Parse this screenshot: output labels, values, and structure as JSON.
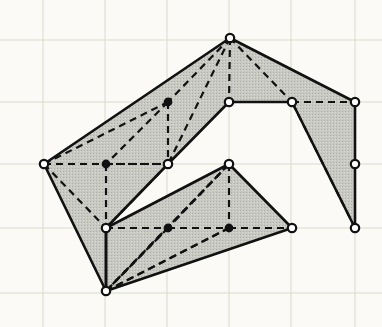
{
  "figure": {
    "title": "Triangulated simple polygon diagram",
    "background_color": "#fbfaf7",
    "grid_color": "#d8dcc8",
    "fill_color": "#c9c9c4",
    "edge_color": "#111111",
    "vertex_open_fill": "#ffffff",
    "vertex_filled_fill": "#111111"
  },
  "grid": {
    "visible": true,
    "vertical_lines": [
      43,
      105,
      167,
      229,
      291,
      355
    ],
    "horizontal_lines": [
      40,
      102,
      164,
      228,
      293
    ]
  },
  "chart_data": {
    "type": "diagram",
    "title": "Triangulated simple polygon diagram",
    "xlabel": "",
    "ylabel": "",
    "xlim": [
      0,
      382
    ],
    "ylim": [
      0,
      327
    ],
    "grid": true,
    "legend": "none",
    "vertices": [
      {
        "id": "A",
        "x": 230,
        "y": 38,
        "marker": "open"
      },
      {
        "id": "B",
        "x": 355,
        "y": 102,
        "marker": "open"
      },
      {
        "id": "C",
        "x": 355,
        "y": 164,
        "marker": "open"
      },
      {
        "id": "D",
        "x": 355,
        "y": 228,
        "marker": "open"
      },
      {
        "id": "E",
        "x": 292,
        "y": 102,
        "marker": "open"
      },
      {
        "id": "F",
        "x": 229,
        "y": 102,
        "marker": "open"
      },
      {
        "id": "G",
        "x": 168,
        "y": 164,
        "marker": "open"
      },
      {
        "id": "H",
        "x": 44,
        "y": 164,
        "marker": "open"
      },
      {
        "id": "I",
        "x": 106,
        "y": 228,
        "marker": "open"
      },
      {
        "id": "J",
        "x": 106,
        "y": 291,
        "marker": "open"
      },
      {
        "id": "K",
        "x": 292,
        "y": 228,
        "marker": "open"
      },
      {
        "id": "L",
        "x": 229,
        "y": 164,
        "marker": "open"
      },
      {
        "id": "M",
        "x": 168,
        "y": 102,
        "marker": "filled"
      },
      {
        "id": "N",
        "x": 106,
        "y": 164,
        "marker": "filled"
      },
      {
        "id": "O",
        "x": 168,
        "y": 228,
        "marker": "filled"
      },
      {
        "id": "P",
        "x": 229,
        "y": 228,
        "marker": "filled"
      }
    ],
    "polygons": [
      {
        "name": "upper-polygon",
        "vertex_ids": [
          "A",
          "B",
          "C",
          "D",
          "E",
          "F",
          "G",
          "I",
          "J",
          "H"
        ],
        "points": "230,38 355,102 355,164 355,228 292,102 229,102 168,164 106,228 106,291 44,164",
        "filled": true
      },
      {
        "name": "lower-polygon",
        "vertex_ids": [
          "L",
          "K",
          "J",
          "I"
        ],
        "points": "229,164 292,228 106,291 106,228",
        "filled": true
      }
    ],
    "solid_edges": [
      [
        "A",
        "H"
      ],
      [
        "A",
        "B"
      ],
      [
        "B",
        "C"
      ],
      [
        "C",
        "D"
      ],
      [
        "D",
        "E"
      ],
      [
        "E",
        "F"
      ],
      [
        "F",
        "G"
      ],
      [
        "G",
        "I"
      ],
      [
        "H",
        "J"
      ],
      [
        "I",
        "J"
      ],
      [
        "L",
        "K"
      ],
      [
        "K",
        "J"
      ],
      [
        "J",
        "I"
      ],
      [
        "I",
        "L"
      ]
    ],
    "dashed_edges": [
      [
        "A",
        "E"
      ],
      [
        "A",
        "M"
      ],
      [
        "A",
        "F"
      ],
      [
        "A",
        "G"
      ],
      [
        "H",
        "M"
      ],
      [
        "H",
        "N"
      ],
      [
        "H",
        "G"
      ],
      [
        "H",
        "I"
      ],
      [
        "M",
        "N"
      ],
      [
        "M",
        "G"
      ],
      [
        "N",
        "G"
      ],
      [
        "N",
        "I"
      ],
      [
        "G",
        "I"
      ],
      [
        "D",
        "E"
      ],
      [
        "E",
        "B"
      ],
      [
        "I",
        "O"
      ],
      [
        "O",
        "P"
      ],
      [
        "P",
        "K"
      ],
      [
        "L",
        "O"
      ],
      [
        "L",
        "P"
      ],
      [
        "L",
        "J"
      ],
      [
        "J",
        "O"
      ],
      [
        "J",
        "P"
      ],
      [
        "J",
        "L"
      ],
      [
        "O",
        "J"
      ],
      [
        "P",
        "J"
      ]
    ]
  }
}
